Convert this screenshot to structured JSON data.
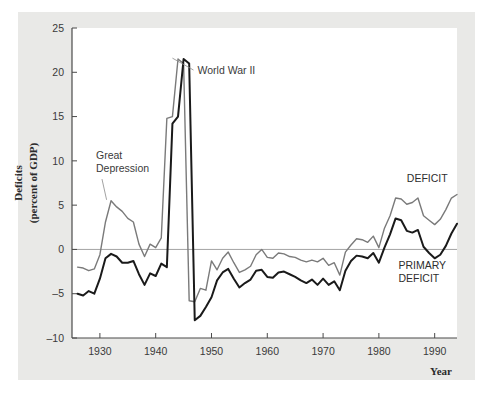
{
  "chart_data": {
    "type": "line",
    "title": "",
    "xlabel": "Year",
    "ylabel": "Deficits (percent of GDP)",
    "ylabel_line1": "Deficits",
    "ylabel_line2": "(percent of GDP)",
    "xlim": [
      1925,
      1994
    ],
    "ylim": [
      -10,
      25
    ],
    "grid": false,
    "zero_line": true,
    "legend_position": "inline-annotation",
    "xticks": [
      1930,
      1940,
      1950,
      1960,
      1970,
      1980,
      1990
    ],
    "yticks": [
      -10,
      -5,
      0,
      5,
      10,
      15,
      20,
      25
    ],
    "ytick_labels": [
      "–10",
      "–5",
      "0",
      "5",
      "10",
      "15",
      "20",
      "25"
    ],
    "xtick_labels": [
      "1930",
      "1940",
      "1950",
      "1960",
      "1970",
      "1980",
      "1990"
    ],
    "annotations": [
      {
        "text": "World War II",
        "x": 1947.5,
        "y": 19.8,
        "leader_to_x": 1943,
        "leader_to_y": 21.6
      },
      {
        "text": "Great Depression",
        "line1": "Great",
        "line2": "Depression",
        "x": 1929.3,
        "y": 10.2,
        "leader_to_x": 1931.2,
        "leader_to_y": 5.6
      },
      {
        "text": "DEFICIT",
        "x": 1985.0,
        "y": 7.6
      },
      {
        "text": "PRIMARY DEFICIT",
        "line1": "PRIMARY",
        "line2": "DEFICIT",
        "x": 1983.5,
        "y": -2.2
      }
    ],
    "x": [
      1926,
      1927,
      1928,
      1929,
      1930,
      1931,
      1932,
      1933,
      1934,
      1935,
      1936,
      1937,
      1938,
      1939,
      1940,
      1941,
      1942,
      1943,
      1944,
      1945,
      1946,
      1947,
      1948,
      1949,
      1950,
      1951,
      1952,
      1953,
      1954,
      1955,
      1956,
      1957,
      1958,
      1959,
      1960,
      1961,
      1962,
      1963,
      1964,
      1965,
      1966,
      1967,
      1968,
      1969,
      1970,
      1971,
      1972,
      1973,
      1974,
      1975,
      1976,
      1977,
      1978,
      1979,
      1980,
      1981,
      1982,
      1983,
      1984,
      1985,
      1986,
      1987,
      1988,
      1989,
      1990,
      1991,
      1992,
      1993,
      1994
    ],
    "series": [
      {
        "name": "DEFICIT",
        "color": "#7a7a7a",
        "linewidth": 1.4,
        "values": [
          -2.0,
          -2.1,
          -2.4,
          -2.2,
          -0.6,
          3.1,
          5.5,
          4.8,
          4.3,
          3.5,
          3.1,
          0.6,
          -0.8,
          0.6,
          0.2,
          1.3,
          14.8,
          15.0,
          21.5,
          21.0,
          -5.8,
          -5.9,
          -4.4,
          -4.6,
          -1.3,
          -2.3,
          -1.0,
          -0.3,
          -1.5,
          -2.6,
          -2.3,
          -1.9,
          -0.6,
          0.0,
          -0.9,
          -1.0,
          -0.4,
          -0.5,
          -0.8,
          -0.9,
          -1.2,
          -1.4,
          -1.2,
          -1.4,
          -1.0,
          -1.8,
          -1.5,
          -2.9,
          -0.3,
          0.5,
          1.2,
          1.1,
          0.8,
          1.5,
          0.2,
          2.4,
          3.8,
          5.8,
          5.7,
          5.1,
          5.3,
          5.8,
          3.8,
          3.3,
          2.8,
          3.4,
          4.5,
          5.8,
          6.2
        ]
      },
      {
        "name": "PRIMARY DEFICIT",
        "color": "#1a1a1a",
        "linewidth": 2.0,
        "values": [
          -5.0,
          -5.2,
          -4.7,
          -5.0,
          -3.3,
          -1.0,
          -0.5,
          -0.8,
          -1.5,
          -1.5,
          -1.3,
          -2.8,
          -4.0,
          -2.7,
          -3.0,
          -1.6,
          -2.0,
          14.2,
          15.0,
          21.5,
          21.0,
          -8.0,
          -7.5,
          -6.5,
          -5.4,
          -3.5,
          -2.6,
          -2.2,
          -3.3,
          -4.3,
          -3.8,
          -3.4,
          -2.4,
          -2.3,
          -3.1,
          -3.2,
          -2.6,
          -2.5,
          -2.8,
          -3.1,
          -3.5,
          -3.8,
          -3.4,
          -4.0,
          -3.3,
          -4.0,
          -3.6,
          -4.6,
          -2.4,
          -1.3,
          -0.7,
          -0.8,
          -1.0,
          -0.4,
          -1.5,
          0.2,
          1.7,
          3.5,
          3.3,
          2.1,
          1.9,
          2.2,
          0.3,
          -0.4,
          -1.0,
          -0.6,
          0.4,
          1.8,
          2.9
        ]
      }
    ]
  },
  "colors": {
    "figure_background": "#e9e9e7",
    "plot_background": "#ffffff",
    "axis": "#4a4a4a",
    "zero_line": "#9a9a9a",
    "deficit_series": "#7a7a7a",
    "primary_deficit_series": "#1a1a1a",
    "text": "#3a3a3a"
  }
}
